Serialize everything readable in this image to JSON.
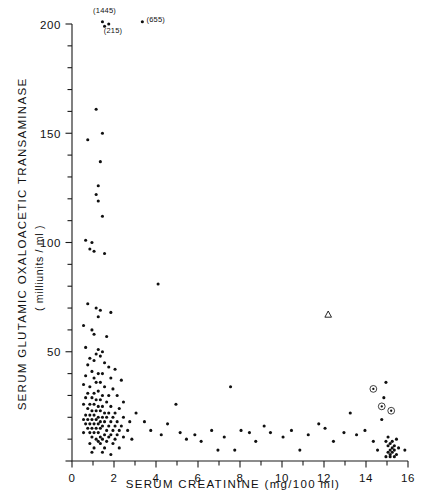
{
  "figure": {
    "kind": "scatter-plot",
    "background": "#ffffff",
    "ink_color": "#101010"
  },
  "chart_data": {
    "type": "scatter",
    "title": "",
    "xlabel": "SERUM CREATININE (mg/100 ml)",
    "ylabel": "SERUM GLUTAMIC OXALOACETIC TRANSAMINASE",
    "ylabel_units": "( milliunits / ml )",
    "xlim": [
      0,
      16
    ],
    "ylim": [
      0,
      200
    ],
    "xticks": [
      0,
      2,
      4,
      6,
      8,
      10,
      12,
      14,
      16
    ],
    "xticklabels": [
      "0",
      "2",
      "4",
      "6",
      "8",
      "10",
      "12",
      "14",
      "16"
    ],
    "xminor_step": 1,
    "yticks": [
      0,
      50,
      100,
      150,
      200
    ],
    "yticklabels": [
      "0",
      "50",
      "100",
      "150",
      "200"
    ],
    "yminor_step": 10,
    "grid": false,
    "legend_position": "none",
    "annotations": [
      {
        "text": "(1445)",
        "x": 1.55,
        "y": 206,
        "anchor": "middle"
      },
      {
        "text": "(215)",
        "x": 1.95,
        "y": 197,
        "anchor": "middle"
      },
      {
        "text": "(655)",
        "x": 3.55,
        "y": 202,
        "anchor": "start"
      }
    ],
    "series": [
      {
        "name": "patients",
        "marker": "dot",
        "points": [
          [
            1.45,
            201
          ],
          [
            1.55,
            199
          ],
          [
            1.75,
            200
          ],
          [
            3.35,
            201
          ],
          [
            1.15,
            161
          ],
          [
            0.75,
            147
          ],
          [
            1.45,
            150
          ],
          [
            1.35,
            137
          ],
          [
            1.25,
            126
          ],
          [
            1.15,
            122
          ],
          [
            1.25,
            119
          ],
          [
            1.45,
            112
          ],
          [
            0.65,
            101
          ],
          [
            0.95,
            100
          ],
          [
            0.85,
            97
          ],
          [
            1.05,
            96
          ],
          [
            1.55,
            95
          ],
          [
            4.1,
            81
          ],
          [
            0.75,
            72
          ],
          [
            1.15,
            70
          ],
          [
            1.35,
            69
          ],
          [
            1.85,
            68
          ],
          [
            1.25,
            66
          ],
          [
            0.55,
            62
          ],
          [
            0.95,
            60
          ],
          [
            1.05,
            58
          ],
          [
            1.65,
            57
          ],
          [
            0.65,
            52
          ],
          [
            1.25,
            51
          ],
          [
            1.45,
            50
          ],
          [
            1.15,
            49
          ],
          [
            1.35,
            48
          ],
          [
            0.85,
            47
          ],
          [
            1.05,
            46
          ],
          [
            1.55,
            45
          ],
          [
            0.75,
            44
          ],
          [
            1.75,
            43
          ],
          [
            2.05,
            42
          ],
          [
            0.95,
            41
          ],
          [
            1.25,
            40
          ],
          [
            1.45,
            40
          ],
          [
            0.65,
            39
          ],
          [
            1.05,
            38
          ],
          [
            1.85,
            38
          ],
          [
            2.35,
            37
          ],
          [
            1.15,
            36
          ],
          [
            1.35,
            36
          ],
          [
            0.55,
            35
          ],
          [
            0.85,
            34
          ],
          [
            1.55,
            34
          ],
          [
            1.95,
            33
          ],
          [
            1.25,
            32
          ],
          [
            1.05,
            31
          ],
          [
            0.75,
            31
          ],
          [
            1.45,
            30
          ],
          [
            1.75,
            30
          ],
          [
            2.15,
            30
          ],
          [
            0.65,
            29
          ],
          [
            0.95,
            29
          ],
          [
            1.15,
            28
          ],
          [
            1.35,
            28
          ],
          [
            1.65,
            27
          ],
          [
            2.45,
            27
          ],
          [
            0.55,
            26
          ],
          [
            0.85,
            26
          ],
          [
            1.05,
            26
          ],
          [
            1.25,
            25
          ],
          [
            1.45,
            25
          ],
          [
            1.85,
            25
          ],
          [
            2.25,
            24
          ],
          [
            0.75,
            24
          ],
          [
            0.95,
            23
          ],
          [
            1.15,
            23
          ],
          [
            1.35,
            23
          ],
          [
            1.55,
            22
          ],
          [
            1.75,
            22
          ],
          [
            2.05,
            22
          ],
          [
            0.65,
            21
          ],
          [
            0.85,
            21
          ],
          [
            1.05,
            21
          ],
          [
            1.25,
            20
          ],
          [
            1.45,
            20
          ],
          [
            1.65,
            20
          ],
          [
            1.95,
            20
          ],
          [
            2.45,
            20
          ],
          [
            0.55,
            19
          ],
          [
            0.75,
            19
          ],
          [
            0.95,
            19
          ],
          [
            1.15,
            19
          ],
          [
            1.35,
            18
          ],
          [
            1.55,
            18
          ],
          [
            1.85,
            18
          ],
          [
            2.15,
            18
          ],
          [
            2.75,
            18
          ],
          [
            0.65,
            17
          ],
          [
            0.85,
            17
          ],
          [
            1.05,
            17
          ],
          [
            1.25,
            17
          ],
          [
            1.45,
            16
          ],
          [
            1.75,
            16
          ],
          [
            2.05,
            16
          ],
          [
            2.35,
            16
          ],
          [
            0.75,
            15
          ],
          [
            0.95,
            15
          ],
          [
            1.15,
            15
          ],
          [
            1.35,
            15
          ],
          [
            1.65,
            14
          ],
          [
            1.95,
            14
          ],
          [
            2.25,
            14
          ],
          [
            2.65,
            14
          ],
          [
            0.55,
            13
          ],
          [
            0.85,
            13
          ],
          [
            1.05,
            13
          ],
          [
            1.25,
            13
          ],
          [
            1.55,
            12
          ],
          [
            1.85,
            12
          ],
          [
            2.15,
            12
          ],
          [
            0.95,
            11
          ],
          [
            1.35,
            11
          ],
          [
            1.75,
            11
          ],
          [
            2.45,
            11
          ],
          [
            1.15,
            10
          ],
          [
            1.45,
            10
          ],
          [
            2.05,
            10
          ],
          [
            2.85,
            10
          ],
          [
            1.25,
            9
          ],
          [
            1.65,
            9
          ],
          [
            0.85,
            8
          ],
          [
            1.35,
            8
          ],
          [
            1.95,
            8
          ],
          [
            1.05,
            6
          ],
          [
            1.55,
            6
          ],
          [
            2.25,
            6
          ],
          [
            0.95,
            4
          ],
          [
            1.45,
            4
          ],
          [
            1.85,
            3
          ],
          [
            3.05,
            22
          ],
          [
            3.45,
            18
          ],
          [
            3.75,
            14
          ],
          [
            4.25,
            12
          ],
          [
            4.55,
            17
          ],
          [
            4.95,
            26
          ],
          [
            5.15,
            13
          ],
          [
            5.45,
            10
          ],
          [
            5.85,
            12
          ],
          [
            6.15,
            9
          ],
          [
            6.65,
            14
          ],
          [
            6.95,
            5
          ],
          [
            7.25,
            11
          ],
          [
            7.55,
            34
          ],
          [
            7.75,
            5
          ],
          [
            8.05,
            14
          ],
          [
            8.45,
            13
          ],
          [
            8.75,
            9
          ],
          [
            9.15,
            16
          ],
          [
            9.45,
            13
          ],
          [
            10.05,
            11
          ],
          [
            10.45,
            14
          ],
          [
            10.85,
            5
          ],
          [
            11.25,
            12
          ],
          [
            11.75,
            17
          ],
          [
            12.05,
            15
          ],
          [
            12.45,
            9
          ],
          [
            12.95,
            13
          ],
          [
            13.25,
            22
          ],
          [
            13.55,
            12
          ],
          [
            13.95,
            14
          ],
          [
            14.35,
            9
          ],
          [
            14.55,
            5
          ],
          [
            14.75,
            19
          ],
          [
            14.85,
            29
          ],
          [
            14.95,
            36
          ],
          [
            14.95,
            9
          ],
          [
            15.05,
            7
          ],
          [
            15.05,
            11
          ],
          [
            15.15,
            8
          ],
          [
            15.15,
            5
          ],
          [
            15.25,
            9
          ],
          [
            15.25,
            6
          ],
          [
            15.35,
            7
          ],
          [
            15.45,
            10
          ],
          [
            15.05,
            4
          ],
          [
            15.15,
            3
          ],
          [
            15.25,
            4
          ],
          [
            15.35,
            5
          ],
          [
            15.45,
            3
          ],
          [
            14.95,
            2
          ],
          [
            15.15,
            2
          ],
          [
            15.35,
            2
          ],
          [
            15.55,
            6
          ],
          [
            15.85,
            5
          ]
        ]
      },
      {
        "name": "open-triangle-case",
        "marker": "triangle",
        "points": [
          [
            12.2,
            67
          ]
        ]
      },
      {
        "name": "circled-dot-cases",
        "marker": "circled-dot",
        "points": [
          [
            14.35,
            33
          ],
          [
            14.75,
            25
          ],
          [
            15.2,
            23
          ]
        ]
      }
    ]
  }
}
